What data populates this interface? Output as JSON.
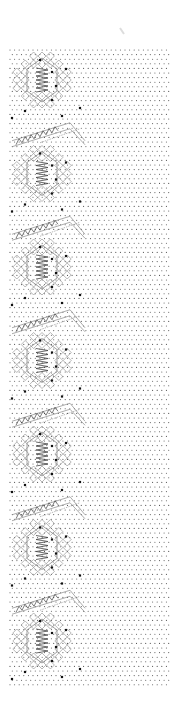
{
  "canvas": {
    "width": 181,
    "height": 718,
    "background": "#ffffff"
  },
  "grid": {
    "x_start": 10,
    "x_end": 170,
    "y_start": 50,
    "y_end": 685,
    "dx": 4.6,
    "dy": 4.6,
    "dot_color": "#555555",
    "dot_radius": 0.55
  },
  "line_color": "#888888",
  "pin_color": "#111111",
  "repeat": {
    "count": 7,
    "first_center_y": 80,
    "spacing": 93.5
  },
  "hexagon": {
    "cx": 42,
    "rx": 15,
    "ry": 22
  },
  "lattice": {
    "cx": 42,
    "half_w": 34,
    "half_h": 32,
    "cell": 8
  },
  "leaf": {
    "x1": 22,
    "y1": 20,
    "x2": 70,
    "y2": -8,
    "x3": 85,
    "y3": 10
  },
  "pins": [
    {
      "dx": 40,
      "dy": -20
    },
    {
      "dx": 52,
      "dy": -8
    },
    {
      "dx": 66,
      "dy": -11
    },
    {
      "dx": 56,
      "dy": 6
    },
    {
      "dx": 52,
      "dy": 20
    },
    {
      "dx": 62,
      "dy": 36
    },
    {
      "dx": 25,
      "dy": 31
    },
    {
      "dx": 12,
      "dy": 38
    },
    {
      "dx": 80,
      "dy": 28
    }
  ],
  "accent_mark": {
    "x": 120,
    "y": 28
  }
}
